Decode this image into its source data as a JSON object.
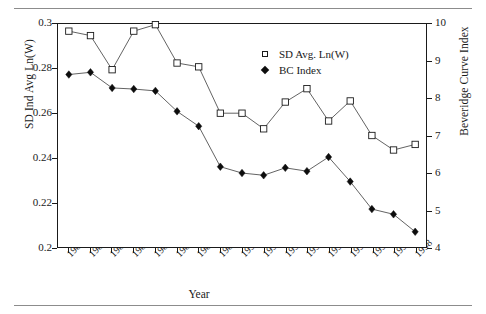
{
  "chart_data": {
    "type": "line",
    "title": "",
    "xlabel": "Year",
    "ylabel": "SD Ind Avg Ln(W)",
    "y2label": "Beveridge Curve Index",
    "grid": false,
    "legend_position": "top-center-right",
    "categories": [
      "1982",
      "1983",
      "1984",
      "1985",
      "1986",
      "1987",
      "1988",
      "1989",
      "1990",
      "1991",
      "1992",
      "1993",
      "1994",
      "1995",
      "1996",
      "1997",
      "1998"
    ],
    "ylim": [
      0.2,
      0.3
    ],
    "yticks": [
      "0.2",
      "0.22",
      "0.24",
      "0.26",
      "0.28",
      "0.3"
    ],
    "ytick_values": [
      0.2,
      0.22,
      0.24,
      0.26,
      0.28,
      0.3
    ],
    "y2lim": [
      4,
      10
    ],
    "y2ticks": [
      "4",
      "5",
      "6",
      "7",
      "8",
      "9",
      "10"
    ],
    "y2tick_values": [
      4,
      5,
      6,
      7,
      8,
      9,
      10
    ],
    "series": [
      {
        "name": "SD Avg. Ln(W)",
        "axis": "left",
        "marker": "open-square",
        "values": [
          0.2968,
          0.2948,
          0.2795,
          0.2968,
          0.2997,
          0.2825,
          0.2808,
          0.26,
          0.26,
          0.253,
          0.265,
          0.271,
          0.2565,
          0.2655,
          0.25,
          0.2435,
          0.246
        ]
      },
      {
        "name": "BC Index",
        "axis": "right",
        "marker": "filled-diamond",
        "values": [
          8.64,
          8.7,
          8.28,
          8.25,
          8.2,
          7.65,
          7.25,
          6.16,
          5.99,
          5.93,
          6.13,
          6.04,
          6.42,
          5.76,
          5.02,
          4.88,
          4.41
        ]
      }
    ]
  },
  "legend": {
    "items": [
      {
        "label": "SD Avg. Ln(W)",
        "marker": "open-square-icon"
      },
      {
        "label": "BC Index",
        "marker": "filled-diamond-icon"
      }
    ]
  }
}
